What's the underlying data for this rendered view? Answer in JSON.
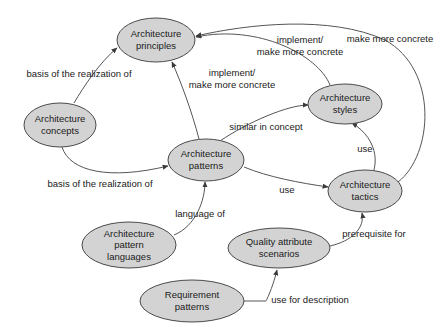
{
  "diagram": {
    "canvas": {
      "width": 447,
      "height": 332
    },
    "style": {
      "node_fill": "#d3d3d3",
      "node_stroke": "#4a4a4a",
      "edge_stroke": "#555555",
      "background": "#ffffff",
      "text_color": "#1a1a1a"
    },
    "nodes": [
      {
        "id": "architecture-principles",
        "lines": [
          "Architecture",
          "principles"
        ],
        "cx": 156,
        "cy": 40,
        "rx": 39,
        "ry": 22
      },
      {
        "id": "architecture-concepts",
        "lines": [
          "Architecture",
          "concepts"
        ],
        "cx": 60,
        "cy": 125,
        "rx": 36,
        "ry": 22
      },
      {
        "id": "architecture-patterns",
        "lines": [
          "Architecture",
          "patterns"
        ],
        "cx": 206,
        "cy": 160,
        "rx": 38,
        "ry": 21
      },
      {
        "id": "architecture-styles",
        "lines": [
          "Architecture",
          "styles"
        ],
        "cx": 345,
        "cy": 104,
        "rx": 37,
        "ry": 20
      },
      {
        "id": "architecture-tactics",
        "lines": [
          "Architecture",
          "tactics"
        ],
        "cx": 365,
        "cy": 191,
        "rx": 37,
        "ry": 21
      },
      {
        "id": "architecture-pattern-languages",
        "lines": [
          "Architecture",
          "pattern",
          "languages"
        ],
        "cx": 129,
        "cy": 245,
        "rx": 47,
        "ry": 23
      },
      {
        "id": "quality-attribute-scenarios",
        "lines": [
          "Quality attribute",
          "scenarios"
        ],
        "cx": 279,
        "cy": 248,
        "rx": 51,
        "ry": 20
      },
      {
        "id": "requirement-patterns",
        "lines": [
          "Requirement",
          "patterns"
        ],
        "cx": 192,
        "cy": 301,
        "rx": 52,
        "ry": 21
      }
    ],
    "edges": [
      {
        "id": "concepts-to-principles",
        "from": "architecture-concepts",
        "to": "architecture-principles",
        "label": "basis of the realization of",
        "label_x": 79,
        "label_y": 74,
        "label_anchor": "middle",
        "path": "M 74 103 C 84 86 100 62 117 48"
      },
      {
        "id": "concepts-to-patterns",
        "from": "architecture-concepts",
        "to": "architecture-patterns",
        "label": "basis of the realization of",
        "label_x": 100,
        "label_y": 184,
        "label_anchor": "middle",
        "path": "M 62 147 C 70 172 110 180 168 166"
      },
      {
        "id": "patterns-to-principles",
        "from": "architecture-patterns",
        "to": "architecture-principles",
        "label": "implement/\nmake more concrete",
        "label_lines": [
          "implement/",
          "make more concrete"
        ],
        "label_x": 232,
        "label_y": 79,
        "label_anchor": "middle",
        "path": "M 199 139 C 192 112 181 82 172 62"
      },
      {
        "id": "styles-to-principles",
        "from": "architecture-styles",
        "to": "architecture-principles",
        "label": "implement/\nmake more concrete",
        "label_lines": [
          "implement/",
          "make more concrete"
        ],
        "label_x": 300,
        "label_y": 46,
        "label_anchor": "middle",
        "path": "M 330 85 C 318 55 258 24 196 37"
      },
      {
        "id": "tactics-to-principles",
        "from": "architecture-tactics",
        "to": "architecture-principles",
        "label": "make more concrete",
        "label_x": 390,
        "label_y": 39,
        "label_anchor": "middle",
        "path": "M 398 182 C 433 155 439 70 385 40 C 330 15 248 24 196 36"
      },
      {
        "id": "patterns-to-styles",
        "from": "architecture-patterns",
        "to": "architecture-styles",
        "label": "similar in concept",
        "label_x": 266,
        "label_y": 127,
        "label_anchor": "middle",
        "path": "M 220 141 C 248 122 288 105 308 105"
      },
      {
        "id": "styles-to-tactics",
        "from": "architecture-styles",
        "to": "architecture-tactics",
        "label": "use",
        "label_x": 365,
        "label_y": 149,
        "label_anchor": "middle",
        "path": "M 366 184 C 380 170 380 140 352 123"
      },
      {
        "id": "patterns-to-tactics",
        "from": "architecture-patterns",
        "to": "architecture-tactics",
        "label": "use",
        "label_x": 287,
        "label_y": 190,
        "label_anchor": "middle",
        "path": "M 244 167 C 268 177 300 183 328 187"
      },
      {
        "id": "pattern-languages-to-patterns",
        "from": "architecture-pattern-languages",
        "to": "architecture-patterns",
        "label": "language of",
        "label_x": 200,
        "label_y": 214,
        "label_anchor": "middle",
        "path": "M 174 235 C 196 226 205 200 205 182"
      },
      {
        "id": "tactics-to-quality-attribute-scenarios",
        "from": "architecture-tactics",
        "to": "architecture-quality",
        "label": "prerequisite for",
        "label_x": 374,
        "label_y": 234,
        "label_anchor": "middle",
        "path": "M 330 246 C 352 241 365 228 362 213"
      },
      {
        "id": "requirement-patterns-to-quality",
        "from": "requirement-patterns",
        "to": "quality-attribute-scenarios",
        "label": "use for description",
        "label_x": 310,
        "label_y": 300,
        "label_anchor": "middle",
        "path": "M 244 301 L 266 301 M 266 301 C 266 301 272 290 277 270"
      }
    ]
  }
}
